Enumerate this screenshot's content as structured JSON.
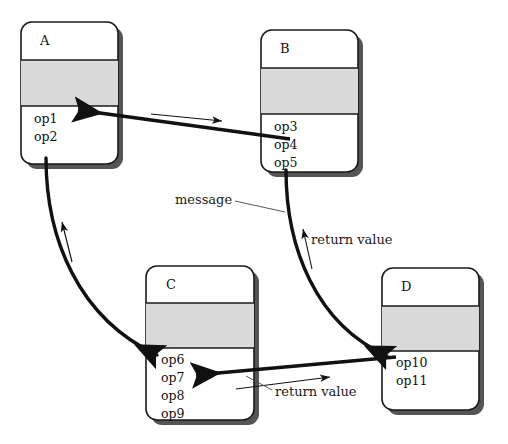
{
  "diagram": {
    "kind": "uml-collaboration-diagram",
    "background_color": "#ffffff",
    "box_fill": "#ffffff",
    "compartment_fill": "#d9d9d9",
    "border_color": "#1a1a1a",
    "shadow_color": "#555555",
    "line_color": "#111111",
    "classes": [
      {
        "id": "A",
        "name": "A",
        "operations": [
          "op1",
          "op2"
        ],
        "x": 21,
        "y": 22,
        "w": 97,
        "h": 142
      },
      {
        "id": "B",
        "name": "B",
        "operations": [
          "op3",
          "op4",
          "op5"
        ],
        "x": 261,
        "y": 30,
        "w": 97,
        "h": 142
      },
      {
        "id": "C",
        "name": "C",
        "operations": [
          "op6",
          "op7",
          "op8",
          "op9"
        ],
        "x": 146,
        "y": 266,
        "w": 108,
        "h": 154
      },
      {
        "id": "D",
        "name": "D",
        "operations": [
          "op10",
          "op11"
        ],
        "x": 382,
        "y": 268,
        "w": 97,
        "h": 142
      }
    ],
    "annotations": [
      {
        "id": "message",
        "label": "message",
        "x": 175,
        "y": 204
      },
      {
        "id": "return-value-upper",
        "label": "return value",
        "x": 311,
        "y": 244
      },
      {
        "id": "return-value-lower",
        "label": "return value",
        "x": 275,
        "y": 396
      }
    ],
    "connectors": [
      {
        "id": "b-to-a-message",
        "from": "B.op4",
        "to": "A.op1",
        "style": "thick-arrow"
      },
      {
        "id": "a-to-c-message",
        "from": "A.op2",
        "to": "C.op6",
        "style": "thick-curve"
      },
      {
        "id": "b-to-d-message",
        "from": "B.op5",
        "to": "D.op10",
        "style": "thick-curve"
      },
      {
        "id": "d-to-c-return",
        "from": "D.op10",
        "to": "C.op8",
        "style": "thick-arrow"
      },
      {
        "id": "flow-hint-top",
        "style": "thin-arrow",
        "direction": "right"
      },
      {
        "id": "flow-hint-left",
        "style": "thin-arrow",
        "direction": "up"
      },
      {
        "id": "flow-hint-mid",
        "style": "thin-arrow",
        "direction": "up"
      },
      {
        "id": "flow-hint-bottom",
        "style": "thin-arrow",
        "direction": "right"
      }
    ]
  }
}
